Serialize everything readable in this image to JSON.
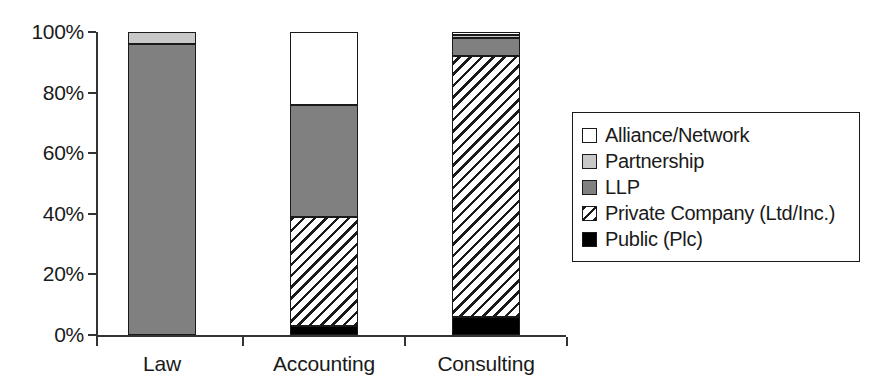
{
  "chart_data": {
    "type": "bar",
    "subtype": "stacked-100-percent",
    "title": "",
    "xlabel": "",
    "ylabel": "",
    "categories": [
      "Law",
      "Accounting",
      "Consulting"
    ],
    "ylim": [
      0,
      100
    ],
    "ytick_labels": [
      "0%",
      "20%",
      "40%",
      "60%",
      "80%",
      "100%"
    ],
    "ytick_values": [
      0,
      20,
      40,
      60,
      80,
      100
    ],
    "grid": false,
    "legend_position": "right",
    "series": [
      {
        "name": "Alliance/Network",
        "color": "#ffffff",
        "pattern": "solid",
        "values": [
          0,
          24,
          1
        ]
      },
      {
        "name": "Partnership",
        "color": "#c8c8c8",
        "pattern": "solid",
        "values": [
          4,
          0,
          1
        ]
      },
      {
        "name": "LLP",
        "color": "#808080",
        "pattern": "solid",
        "values": [
          96,
          37,
          6
        ]
      },
      {
        "name": "Private Company (Ltd/Inc.)",
        "color": "#ffffff",
        "pattern": "diagonal-hatch",
        "values": [
          0,
          36,
          86
        ]
      },
      {
        "name": "Public (Plc)",
        "color": "#000000",
        "pattern": "solid",
        "values": [
          0,
          3,
          6
        ]
      }
    ],
    "stacks": [
      {
        "category": "Law",
        "segments": [
          {
            "name": "Partnership",
            "value": 4,
            "from": 96,
            "to": 100,
            "fill": "lightgray"
          },
          {
            "name": "LLP",
            "value": 96,
            "from": 0,
            "to": 96,
            "fill": "gray"
          }
        ]
      },
      {
        "category": "Accounting",
        "segments": [
          {
            "name": "Alliance/Network",
            "value": 24,
            "from": 76,
            "to": 100,
            "fill": "white"
          },
          {
            "name": "LLP",
            "value": 37,
            "from": 39,
            "to": 76,
            "fill": "gray"
          },
          {
            "name": "Private Company (Ltd/Inc.)",
            "value": 36,
            "from": 3,
            "to": 39,
            "fill": "hatch"
          },
          {
            "name": "Public (Plc)",
            "value": 3,
            "from": 0,
            "to": 3,
            "fill": "black"
          }
        ]
      },
      {
        "category": "Consulting",
        "segments": [
          {
            "name": "Alliance/Network",
            "value": 1,
            "from": 99,
            "to": 100,
            "fill": "white"
          },
          {
            "name": "Partnership",
            "value": 1,
            "from": 98,
            "to": 99,
            "fill": "lightgray"
          },
          {
            "name": "LLP",
            "value": 6,
            "from": 92,
            "to": 98,
            "fill": "gray"
          },
          {
            "name": "Private Company (Ltd/Inc.)",
            "value": 86,
            "from": 6,
            "to": 92,
            "fill": "hatch"
          },
          {
            "name": "Public (Plc)",
            "value": 6,
            "from": 0,
            "to": 6,
            "fill": "black"
          }
        ]
      }
    ]
  },
  "legend": {
    "items": [
      {
        "label": "Alliance/Network",
        "swatch": "white"
      },
      {
        "label": "Partnership",
        "swatch": "lightgray"
      },
      {
        "label": "LLP",
        "swatch": "gray"
      },
      {
        "label": "Private Company (Ltd/Inc.)",
        "swatch": "hatch"
      },
      {
        "label": "Public (Plc)",
        "swatch": "black"
      }
    ]
  },
  "colors": {
    "alliance_network": "#ffffff",
    "partnership": "#c8c8c8",
    "llp": "#808080",
    "private_company": "#ffffff",
    "public_plc": "#000000",
    "axis": "#333333",
    "text": "#1a1a1a"
  }
}
